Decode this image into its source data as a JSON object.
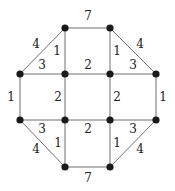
{
  "diagram": {
    "type": "weighted-graph",
    "nodes": [
      {
        "id": "T1",
        "x": 65,
        "y": 28
      },
      {
        "id": "T2",
        "x": 110,
        "y": 28
      },
      {
        "id": "L1",
        "x": 20,
        "y": 74
      },
      {
        "id": "M1",
        "x": 65,
        "y": 74
      },
      {
        "id": "M2",
        "x": 110,
        "y": 74
      },
      {
        "id": "R1",
        "x": 156,
        "y": 74
      },
      {
        "id": "L2",
        "x": 20,
        "y": 120
      },
      {
        "id": "M3",
        "x": 65,
        "y": 120
      },
      {
        "id": "M4",
        "x": 110,
        "y": 120
      },
      {
        "id": "R2",
        "x": 156,
        "y": 120
      },
      {
        "id": "B1",
        "x": 65,
        "y": 167
      },
      {
        "id": "B2",
        "x": 110,
        "y": 167
      }
    ],
    "edges": [
      {
        "from": "T1",
        "to": "T2",
        "weight": "7",
        "lx": 88,
        "ly": 16
      },
      {
        "from": "L1",
        "to": "T1",
        "weight": "4",
        "lx": 36,
        "ly": 44
      },
      {
        "from": "T1",
        "to": "M1",
        "weight": "1",
        "lx": 57,
        "ly": 51
      },
      {
        "from": "T2",
        "to": "R1",
        "weight": "4",
        "lx": 140,
        "ly": 44
      },
      {
        "from": "T2",
        "to": "M2",
        "weight": "1",
        "lx": 117,
        "ly": 51
      },
      {
        "from": "L1",
        "to": "M1",
        "weight": "3",
        "lx": 42,
        "ly": 65
      },
      {
        "from": "M1",
        "to": "M2",
        "weight": "2",
        "lx": 88,
        "ly": 65
      },
      {
        "from": "M2",
        "to": "R1",
        "weight": "3",
        "lx": 133,
        "ly": 65
      },
      {
        "from": "L1",
        "to": "L2",
        "weight": "1",
        "lx": 11,
        "ly": 97
      },
      {
        "from": "M1",
        "to": "M3",
        "weight": "2",
        "lx": 58,
        "ly": 97
      },
      {
        "from": "M2",
        "to": "M4",
        "weight": "2",
        "lx": 117,
        "ly": 97
      },
      {
        "from": "R1",
        "to": "R2",
        "weight": "1",
        "lx": 163,
        "ly": 97
      },
      {
        "from": "L2",
        "to": "M3",
        "weight": "3",
        "lx": 42,
        "ly": 129
      },
      {
        "from": "M3",
        "to": "M4",
        "weight": "2",
        "lx": 88,
        "ly": 129
      },
      {
        "from": "M4",
        "to": "R2",
        "weight": "3",
        "lx": 133,
        "ly": 129
      },
      {
        "from": "L2",
        "to": "B1",
        "weight": "4",
        "lx": 36,
        "ly": 149
      },
      {
        "from": "M3",
        "to": "B1",
        "weight": "1",
        "lx": 58,
        "ly": 143
      },
      {
        "from": "M4",
        "to": "B2",
        "weight": "1",
        "lx": 117,
        "ly": 143
      },
      {
        "from": "R2",
        "to": "B2",
        "weight": "4",
        "lx": 140,
        "ly": 149
      },
      {
        "from": "B1",
        "to": "B2",
        "weight": "7",
        "lx": 88,
        "ly": 178
      }
    ]
  }
}
